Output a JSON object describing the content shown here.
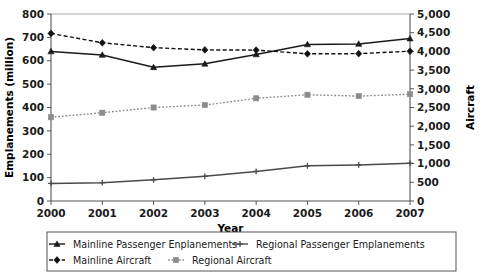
{
  "chart_data": {
    "type": "line",
    "title": "",
    "xlabel": "Year",
    "ylabel": "Emplanements (million)",
    "y2label": "Aircraft",
    "categories": [
      "2000",
      "2001",
      "2002",
      "2003",
      "2004",
      "2005",
      "2006",
      "2007"
    ],
    "x": [
      2000,
      2001,
      2002,
      2003,
      2004,
      2005,
      2006,
      2007
    ],
    "ylim": [
      0,
      800
    ],
    "yticks": [
      0,
      100,
      200,
      300,
      400,
      500,
      600,
      700,
      800
    ],
    "yticklabels": [
      "0",
      "100",
      "200",
      "300",
      "400",
      "500",
      "600",
      "700",
      "800"
    ],
    "y2lim": [
      0,
      5000
    ],
    "y2ticks": [
      0,
      500,
      1000,
      1500,
      2000,
      2500,
      3000,
      3500,
      4000,
      4500,
      5000
    ],
    "y2ticklabels": [
      "0",
      "500",
      "1,000",
      "1,500",
      "2,000",
      "2,500",
      "3,000",
      "3,500",
      "4,000",
      "4,500",
      "5,000"
    ],
    "grid": false,
    "legend_position": "bottom",
    "series": [
      {
        "name": "Mainline Passenger Enplanements",
        "axis": "left",
        "style": "solid",
        "marker": "triangle",
        "color": "#1a1a1a",
        "values": [
          640,
          625,
          572,
          587,
          627,
          670,
          672,
          695
        ]
      },
      {
        "name": "Regional Passenger Emplanements",
        "axis": "right",
        "style": "solid",
        "marker": "cross",
        "color": "#4a4a4a",
        "values": [
          470,
          490,
          565,
          660,
          790,
          940,
          965,
          1010
        ]
      },
      {
        "name": "Mainline Aircraft",
        "axis": "right",
        "style": "dashed",
        "marker": "diamond",
        "color": "#111111",
        "values": [
          4480,
          4230,
          4100,
          4040,
          4035,
          3935,
          3940,
          4005
        ]
      },
      {
        "name": "Regional Aircraft",
        "axis": "right",
        "style": "dotted",
        "marker": "square",
        "color": "#8c8c8c",
        "values": [
          2240,
          2360,
          2500,
          2565,
          2745,
          2840,
          2805,
          2855
        ]
      }
    ]
  },
  "legend": {
    "entries": [
      {
        "label": "Mainline Passenger Enplanements"
      },
      {
        "label": "Regional Passenger Emplanements"
      },
      {
        "label": "Mainline Aircraft"
      },
      {
        "label": "Regional Aircraft"
      }
    ]
  }
}
